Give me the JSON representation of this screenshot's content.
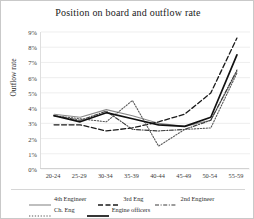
{
  "chart_data": {
    "type": "line",
    "title": "Position on board and outflow rate",
    "xlabel": "",
    "ylabel": "Outflow rate",
    "categories": [
      "20-24",
      "25-29",
      "30-34",
      "35-39",
      "40-44",
      "45-49",
      "50-54",
      "55-59"
    ],
    "ylim": [
      0,
      9
    ],
    "yticks": [
      "0%",
      "1%",
      "2%",
      "3%",
      "4%",
      "5%",
      "6%",
      "7%",
      "8%",
      "9%"
    ],
    "ytick_values": [
      0,
      1,
      2,
      3,
      4,
      5,
      6,
      7,
      8,
      9
    ],
    "grid": true,
    "legend_position": "bottom",
    "series": [
      {
        "name": "4th Engineer",
        "style": "solid-thin",
        "color": "#8a8a8a",
        "values": [
          3.6,
          3.4,
          3.9,
          3.5,
          3.0,
          2.8,
          3.2,
          6.4
        ]
      },
      {
        "name": "3rd Eng",
        "style": "dashed",
        "color": "#1a1a1a",
        "values": [
          2.9,
          2.9,
          2.5,
          2.7,
          3.1,
          3.6,
          5.0,
          8.6
        ]
      },
      {
        "name": "2nd Engineer",
        "style": "dash-dot",
        "color": "#3a3a3a",
        "values": [
          3.5,
          3.2,
          3.8,
          2.6,
          2.5,
          2.6,
          3.2,
          6.5
        ]
      },
      {
        "name": "Ch. Eng",
        "style": "dotted",
        "color": "#5a5a5a",
        "values": [
          3.5,
          3.3,
          3.1,
          4.5,
          1.5,
          2.6,
          2.7,
          6.3
        ]
      },
      {
        "name": "Engine officers",
        "style": "solid-thick",
        "color": "#111111",
        "values": [
          3.5,
          3.1,
          3.7,
          3.3,
          2.9,
          2.8,
          3.4,
          7.5
        ]
      }
    ]
  }
}
